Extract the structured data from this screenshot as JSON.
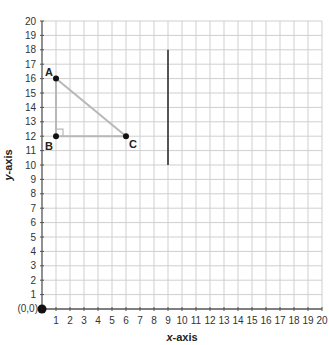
{
  "chart_data": {
    "type": "scatter",
    "title": "",
    "xlabel_var": "x",
    "xlabel_rest": "-axis",
    "ylabel_var": "y",
    "ylabel_rest": "-axis",
    "xlim": [
      0,
      20
    ],
    "ylim": [
      0,
      20
    ],
    "grid": true,
    "x_ticks": [
      1,
      2,
      3,
      4,
      5,
      6,
      7,
      8,
      9,
      10,
      11,
      12,
      13,
      14,
      15,
      16,
      17,
      18,
      19,
      20
    ],
    "y_ticks": [
      1,
      2,
      3,
      4,
      5,
      6,
      7,
      8,
      9,
      10,
      11,
      12,
      13,
      14,
      15,
      16,
      17,
      18,
      19,
      20
    ],
    "origin_label": "(0,0)",
    "points": [
      {
        "label": "A",
        "x": 1,
        "y": 16
      },
      {
        "label": "B",
        "x": 1,
        "y": 12
      },
      {
        "label": "C",
        "x": 6,
        "y": 12
      }
    ],
    "triangle": {
      "vertices": [
        "A",
        "B",
        "C"
      ],
      "right_angle_at": "B"
    },
    "vertical_segment": {
      "x": 9,
      "y_start": 10,
      "y_end": 18
    },
    "colors": {
      "grid": "#cfcfcf",
      "axis": "#555555",
      "triangle": "#b8b8b8",
      "segment": "#555555",
      "point": "#111111"
    }
  }
}
